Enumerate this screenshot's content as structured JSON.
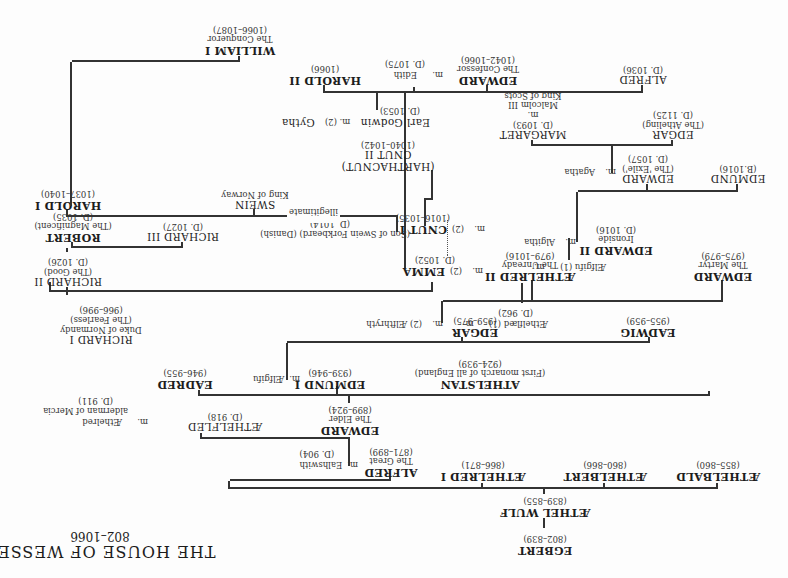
{
  "title": {
    "main": "THE HOUSE OF WESSEX",
    "years": "802–1066"
  },
  "orientation": "rotated 180 degrees (upside down scan)",
  "people": {
    "egbert": {
      "name": "EGBERT",
      "dates": "(802–839)"
    },
    "aethelwulf": {
      "name": "ÆTHEL WULF",
      "dates": "(839–855)"
    },
    "aethelbald": {
      "name": "ÆTHELBALD",
      "dates": "(855–860)"
    },
    "aethelbert": {
      "name": "ÆTHELBERT",
      "dates": "(860–866)"
    },
    "aethelred1": {
      "name": "ÆTHELRED I",
      "dates": "(866–871)"
    },
    "alfred": {
      "name": "ALFRED",
      "epithet": "The Great",
      "dates": "(871–899)"
    },
    "ealhswith": {
      "m": "m.",
      "name": "Ealhswith",
      "dates": "(D. 904)"
    },
    "edward_elder": {
      "name": "EDWARD",
      "epithet": "The Elder",
      "dates": "(899–924)"
    },
    "aethelfled": {
      "name": "ÆTHELFLED",
      "dates": "(D. 918)"
    },
    "aethelred_mercia": {
      "m": "m.",
      "name": "Æthelred",
      "desc": "alderman of Mercia",
      "dates": "(D. 911)"
    },
    "eadred": {
      "name": "EADRED",
      "dates": "(946–955)"
    },
    "edmund1": {
      "name": "EDMUND I",
      "dates": "(939–946)"
    },
    "aelfgifu_edmund": {
      "m": "m.",
      "name": "Ælfgifu"
    },
    "athelstan": {
      "name": "ATHELSTAN",
      "desc": "(First monarch of all England)",
      "dates": "(924–939)"
    },
    "edgar": {
      "name": "EDGAR",
      "dates": "(959–975)"
    },
    "aelfthryth": {
      "m": "m.",
      "name": "(2) Ælfthryth"
    },
    "aethelflaed1": {
      "m": "m.",
      "name": "Æthelflæd (1)",
      "dates": "(D. 962)"
    },
    "eadwig": {
      "name": "EADWIG",
      "dates": "(955–959)"
    },
    "edward_martyr": {
      "name": "EDWARD",
      "epithet": "The Martyr",
      "dates": "(975–979)"
    },
    "aelfgifu1": {
      "name": "Ælfgifu (1)",
      "m": "m."
    },
    "aethelred2": {
      "name": "ÆTHELRED II",
      "epithet": "The Unready",
      "dates": "(979–1016)"
    },
    "emma": {
      "m": "m.",
      "prefix": "(2)",
      "name": "EMMA",
      "dates": "(D. 1052)"
    },
    "edward2": {
      "name": "EDWARD II",
      "epithet": "Ironside",
      "dates": "(D. 1016)"
    },
    "algitha": {
      "m": "m.",
      "name": "Algitha"
    },
    "edmund": {
      "name": "EDMUND",
      "dates": "(B.1016)"
    },
    "edward_exile": {
      "name": "EDWARD",
      "epithet": "(The 'Exile')",
      "dates": "(D. 1057)"
    },
    "agatha": {
      "m": "m.",
      "name": "Agatha"
    },
    "edgar_aetheling": {
      "name": "EDGAR",
      "epithet": "(The Atheling)",
      "dates": "(D. 1125)"
    },
    "margaret": {
      "name": "MARGARET",
      "dates": "(D. 1093)",
      "m": "m.",
      "spouse": "Malcolm III",
      "spouse_desc": "King of Scots"
    },
    "cnut1": {
      "m": "m.",
      "prefix": "(2)",
      "name": "CNUT I",
      "dates": "(1016–1035)",
      "desc": "(Son of Swein Forkbeard) (Danish)",
      "died": "(D. 1014)"
    },
    "harthacnut": {
      "name": "(HARTHACNUT)",
      "name2": "CNUT II",
      "dates": "(1040–1042)"
    },
    "illegitimate": "illegitimate",
    "swein": {
      "name": "SWEIN",
      "desc": "King of Norway"
    },
    "harold1": {
      "name": "HAROLD I",
      "dates": "(1037–1040)"
    },
    "edward_confessor": {
      "name": "EDWARD",
      "epithet": "The Confessor",
      "dates": "(1042–1066)"
    },
    "alfred2": {
      "name": "ALFRED",
      "dates": "(D. 1036)"
    },
    "edith": {
      "m": "m.",
      "name": "Edith",
      "dates": "(D. 1075)"
    },
    "harold2": {
      "name": "HAROLD II",
      "dates": "(1066)"
    },
    "godwin": {
      "name": "Earl Godwin",
      "m": "m. (2)",
      "spouse": "Gytha",
      "dates": "(D. 1053)"
    },
    "richard1": {
      "name": "RICHARD I",
      "desc": "Duke of Normandy",
      "epithet": "(The Fearless)",
      "dates": "(966–996)"
    },
    "richard2": {
      "name": "RICHARD II",
      "epithet": "(The Good)",
      "dates": "(D. 1026)"
    },
    "richard3": {
      "name": "RICHARD III",
      "dates": "(D. 1027)"
    },
    "robert": {
      "name": "ROBERT",
      "epithet": "(The Magnificent)",
      "dates": "(D. 1035)"
    },
    "william1": {
      "name": "WILLIAM I",
      "epithet": "The Conqueror",
      "dates": "(1066–1087)"
    }
  }
}
